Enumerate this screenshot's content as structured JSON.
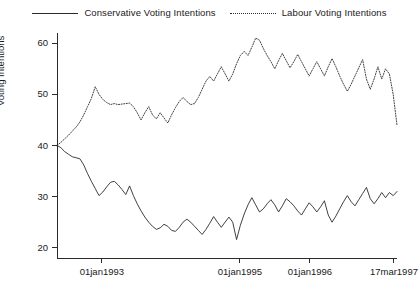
{
  "chart_data": {
    "type": "line",
    "title": "",
    "xlabel": "",
    "ylabel": "Voting Intentions",
    "ylim": [
      18,
      62
    ],
    "yticks": [
      20,
      30,
      40,
      50,
      60
    ],
    "ytick_labels": [
      "20",
      "30",
      "40",
      "50",
      "60"
    ],
    "xlim": [
      "01apr1992",
      "17mar1997"
    ],
    "xticks": [
      "01jan1993",
      "01jan1995",
      "01jan1996",
      "17mar1997"
    ],
    "xtick_labels": [
      "01jan1993",
      "01jan1995",
      "01jan1996",
      "17mar1997"
    ],
    "xtick_positions": [
      0.132,
      0.538,
      0.744,
      0.991
    ],
    "grid": false,
    "legend_position": "top",
    "series": [
      {
        "name": "Conservative Voting Intentions",
        "key": "conservative",
        "style": "solid",
        "color": "#2b2b2b",
        "values": [
          40.0,
          39.6,
          38.8,
          38.3,
          37.8,
          37.6,
          37.4,
          36.2,
          34.5,
          33.0,
          31.6,
          30.2,
          30.9,
          31.9,
          32.8,
          33.0,
          32.3,
          31.4,
          30.4,
          32.1,
          30.2,
          28.6,
          27.2,
          26.0,
          25.0,
          24.2,
          23.6,
          23.9,
          24.6,
          24.2,
          23.4,
          23.2,
          24.0,
          25.0,
          25.6,
          25.0,
          24.2,
          23.4,
          22.6,
          23.6,
          24.8,
          26.1,
          25.0,
          24.0,
          25.0,
          26.0,
          25.0,
          21.6,
          24.4,
          26.6,
          28.4,
          29.8,
          28.4,
          27.0,
          27.6,
          28.6,
          29.4,
          28.4,
          27.0,
          28.2,
          29.6,
          29.0,
          28.2,
          27.2,
          26.4,
          27.6,
          28.8,
          28.0,
          27.0,
          28.0,
          29.2,
          26.4,
          25.0,
          26.2,
          27.6,
          29.0,
          30.2,
          29.0,
          28.2,
          29.4,
          30.6,
          31.8,
          29.6,
          28.6,
          29.6,
          30.8,
          29.8,
          30.8,
          30.2,
          31.0
        ]
      },
      {
        "name": "Labour Voting Intentions",
        "key": "labour",
        "style": "dotted",
        "color": "#2b2b2b",
        "values": [
          40.0,
          40.6,
          41.3,
          42.0,
          42.8,
          43.6,
          44.6,
          46.0,
          47.6,
          49.2,
          51.5,
          50.0,
          49.0,
          48.4,
          48.0,
          48.2,
          48.0,
          48.1,
          48.2,
          48.3,
          47.6,
          46.4,
          45.0,
          46.4,
          47.6,
          46.0,
          45.2,
          46.4,
          45.4,
          44.4,
          46.0,
          47.4,
          48.6,
          49.4,
          48.6,
          48.0,
          48.2,
          49.4,
          51.0,
          52.6,
          53.5,
          52.6,
          54.0,
          55.4,
          54.0,
          52.6,
          54.0,
          56.0,
          57.6,
          58.4,
          57.6,
          59.2,
          61.0,
          60.6,
          59.0,
          57.6,
          56.4,
          55.0,
          56.6,
          58.0,
          56.6,
          55.2,
          56.4,
          57.8,
          56.4,
          55.0,
          53.6,
          55.0,
          56.4,
          55.0,
          53.6,
          55.4,
          57.0,
          55.4,
          53.6,
          52.0,
          50.6,
          52.0,
          53.6,
          55.2,
          56.8,
          53.0,
          51.0,
          53.0,
          55.4,
          53.0,
          55.0,
          54.0,
          50.0,
          44.0
        ]
      }
    ]
  },
  "legend": {
    "items": [
      {
        "label": "Conservative Voting Intentions",
        "style": "solid"
      },
      {
        "label": "Labour Voting Intentions",
        "style": "dotted"
      }
    ]
  },
  "axes": {
    "y_title": "Voting Intentions"
  }
}
